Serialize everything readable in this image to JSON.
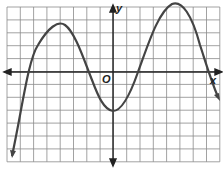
{
  "graph": {
    "x_label": "x",
    "y_label": "y",
    "origin_label": "O",
    "grid": {
      "cols": 16,
      "rows": 12,
      "x_min": -8,
      "x_max": 8,
      "y_min": -7,
      "y_max": 5
    },
    "curve": {
      "type": "polynomial",
      "zeros": [
        -6,
        -2,
        2,
        7
      ],
      "y_intercept": -3,
      "local_max": [
        [
          -4,
          3.6
        ],
        [
          5,
          4.8
        ]
      ],
      "local_min": [
        [
          0,
          -3
        ]
      ],
      "end_behavior": "both ends down"
    },
    "colors": {
      "grid": "#888888",
      "axis": "#222222",
      "curve": "#444444"
    }
  }
}
